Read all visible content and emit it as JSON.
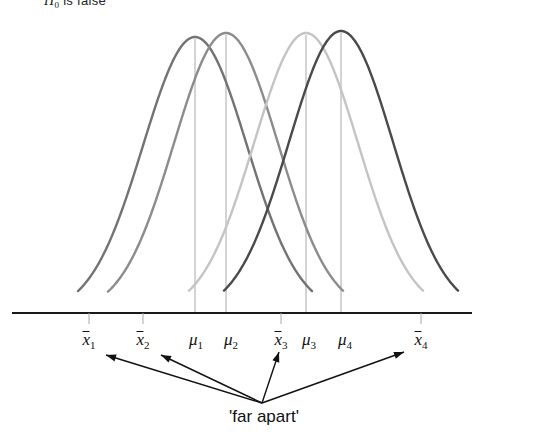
{
  "figure": {
    "header": {
      "prefix": "H",
      "subscript": "0",
      "suffix": " is false"
    },
    "annotation": "'far apart'",
    "colors": {
      "curve1": "#737373",
      "curve2": "#8c8c8c",
      "curve3": "#c4c4c4",
      "curve4": "#4a4a4a",
      "axis": "#1a1a1a",
      "droplines": "#a8a8a8",
      "arrows": "#111111"
    },
    "axis_labels": [
      {
        "name": "xbar1",
        "base": "x",
        "sub": "1",
        "overbar": true,
        "x": 89
      },
      {
        "name": "xbar2",
        "base": "x",
        "sub": "2",
        "overbar": true,
        "x": 143
      },
      {
        "name": "mu1",
        "base": "μ",
        "sub": "1",
        "overbar": false,
        "x": 196
      },
      {
        "name": "mu2",
        "base": "μ",
        "sub": "2",
        "overbar": false,
        "x": 231
      },
      {
        "name": "xbar3",
        "base": "x",
        "sub": "3",
        "overbar": true,
        "x": 281
      },
      {
        "name": "mu3",
        "base": "μ",
        "sub": "3",
        "overbar": false,
        "x": 309
      },
      {
        "name": "mu4",
        "base": "μ",
        "sub": "4",
        "overbar": false,
        "x": 345
      },
      {
        "name": "xbar4",
        "base": "x",
        "sub": "4",
        "overbar": true,
        "x": 421
      }
    ]
  },
  "chart_data": {
    "type": "line",
    "title": "H0 is false",
    "xlabel": "",
    "ylabel": "",
    "grid": false,
    "legend": "none",
    "axis": {
      "baseline_y": 313,
      "x_start": 12,
      "x_end": 472
    },
    "series": [
      {
        "name": "distribution-1",
        "mean_label": "μ1",
        "peak_x": 195,
        "peak_y": 37,
        "sigma_px": 52,
        "color": "#737373",
        "left_x": 78,
        "right_x": 312
      },
      {
        "name": "distribution-2",
        "mean_label": "μ2",
        "peak_x": 226,
        "peak_y": 33,
        "sigma_px": 52,
        "color": "#8c8c8c",
        "left_x": 108,
        "right_x": 343
      },
      {
        "name": "distribution-3",
        "mean_label": "μ3",
        "peak_x": 306,
        "peak_y": 33,
        "sigma_px": 52,
        "color": "#c4c4c4",
        "left_x": 189,
        "right_x": 423
      },
      {
        "name": "distribution-4",
        "mean_label": "μ4",
        "peak_x": 341,
        "peak_y": 31,
        "sigma_px": 52,
        "color": "#4a4a4a",
        "left_x": 224,
        "right_x": 458
      }
    ],
    "sample_means": [
      {
        "name": "xbar1",
        "x": 89,
        "tick": true
      },
      {
        "name": "xbar2",
        "x": 143,
        "tick": true
      },
      {
        "name": "xbar3",
        "x": 281,
        "tick": true
      },
      {
        "name": "xbar4",
        "x": 421,
        "tick": true
      }
    ],
    "arrows": {
      "origin": {
        "x": 262,
        "y": 403
      },
      "targets": [
        {
          "name": "arrow-to-xbar1",
          "x": 106,
          "y": 355
        },
        {
          "name": "arrow-to-xbar2",
          "x": 161,
          "y": 355
        },
        {
          "name": "arrow-to-xbar3",
          "x": 279,
          "y": 352
        },
        {
          "name": "arrow-to-xbar4",
          "x": 404,
          "y": 352
        }
      ]
    }
  }
}
